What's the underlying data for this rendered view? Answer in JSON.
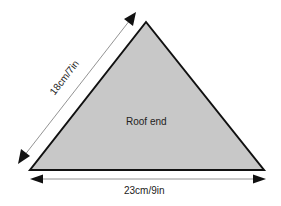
{
  "diagram": {
    "shape": "triangle",
    "fill_color": "#c8c8c8",
    "stroke_color": "#111111",
    "center_label": "Roof end",
    "dimensions": {
      "side": "18cm/7in",
      "base": "23cm/9in"
    }
  }
}
